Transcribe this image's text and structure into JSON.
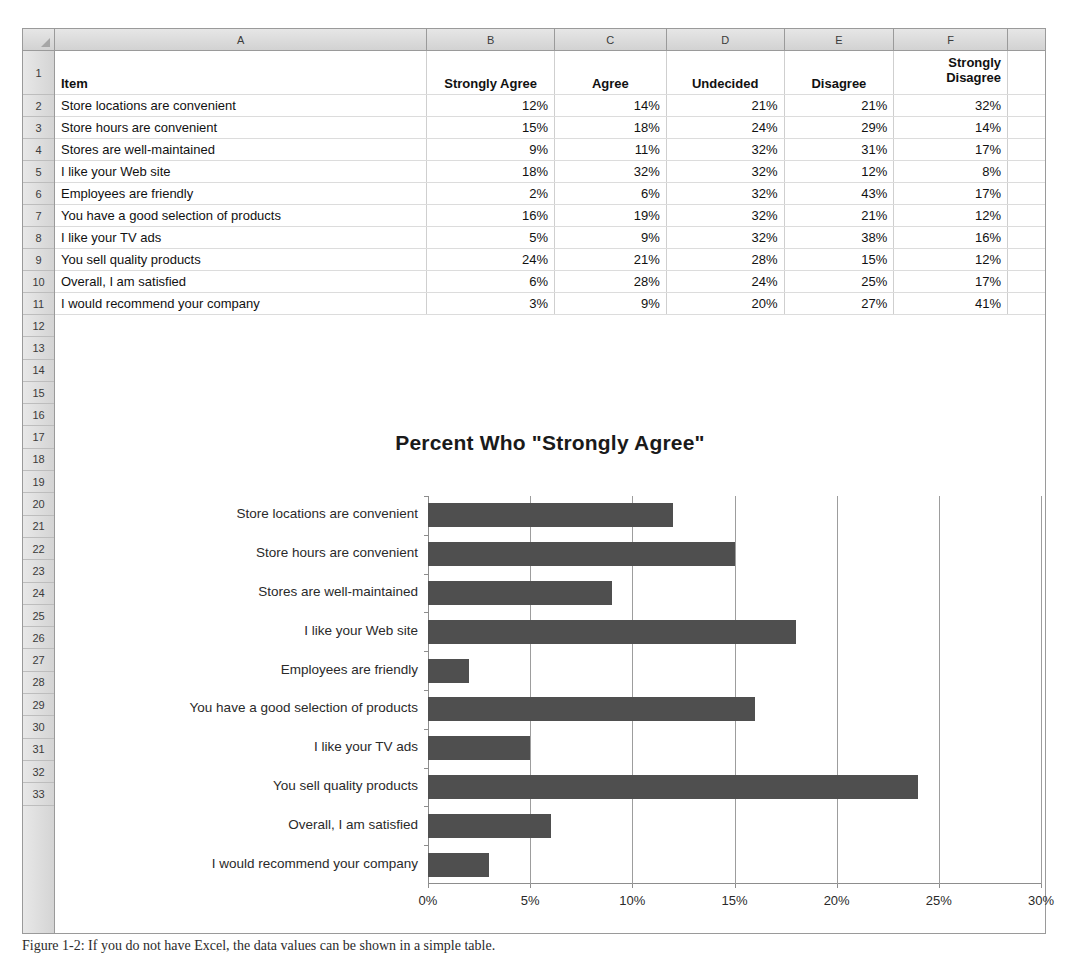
{
  "spreadsheet": {
    "corner_icon": "select-all-triangle-icon",
    "column_letters": [
      "A",
      "B",
      "C",
      "D",
      "E",
      "F"
    ],
    "row_numbers": [
      "1",
      "2",
      "3",
      "4",
      "5",
      "6",
      "7",
      "8",
      "9",
      "10",
      "11",
      "12",
      "13",
      "14",
      "15",
      "16",
      "17",
      "18",
      "19",
      "20",
      "21",
      "22",
      "23",
      "24",
      "25",
      "26",
      "27",
      "28",
      "29",
      "30",
      "31",
      "32",
      "33"
    ],
    "headers": [
      "Item",
      "Strongly Agree",
      "Agree",
      "Undecided",
      "Disagree",
      "Strongly Disagree"
    ],
    "header_wrapped": {
      "f_line1": "Strongly",
      "f_line2": "Disagree"
    },
    "rows": [
      {
        "row": "2",
        "item": "Store locations are convenient",
        "strongly_agree": "12%",
        "agree": "14%",
        "undecided": "21%",
        "disagree": "21%",
        "strongly_disagree": "32%"
      },
      {
        "row": "3",
        "item": "Store hours are convenient",
        "strongly_agree": "15%",
        "agree": "18%",
        "undecided": "24%",
        "disagree": "29%",
        "strongly_disagree": "14%"
      },
      {
        "row": "4",
        "item": "Stores are well-maintained",
        "strongly_agree": "9%",
        "agree": "11%",
        "undecided": "32%",
        "disagree": "31%",
        "strongly_disagree": "17%"
      },
      {
        "row": "5",
        "item": "I like your Web site",
        "strongly_agree": "18%",
        "agree": "32%",
        "undecided": "32%",
        "disagree": "12%",
        "strongly_disagree": "8%"
      },
      {
        "row": "6",
        "item": "Employees are friendly",
        "strongly_agree": "2%",
        "agree": "6%",
        "undecided": "32%",
        "disagree": "43%",
        "strongly_disagree": "17%"
      },
      {
        "row": "7",
        "item": "You have a good selection of products",
        "strongly_agree": "16%",
        "agree": "19%",
        "undecided": "32%",
        "disagree": "21%",
        "strongly_disagree": "12%"
      },
      {
        "row": "8",
        "item": "I like your TV ads",
        "strongly_agree": "5%",
        "agree": "9%",
        "undecided": "32%",
        "disagree": "38%",
        "strongly_disagree": "16%"
      },
      {
        "row": "9",
        "item": "You sell quality products",
        "strongly_agree": "24%",
        "agree": "21%",
        "undecided": "28%",
        "disagree": "15%",
        "strongly_disagree": "12%"
      },
      {
        "row": "10",
        "item": "Overall, I am satisfied",
        "strongly_agree": "6%",
        "agree": "28%",
        "undecided": "24%",
        "disagree": "25%",
        "strongly_disagree": "17%"
      },
      {
        "row": "11",
        "item": "I would recommend your company",
        "strongly_agree": "3%",
        "agree": "9%",
        "undecided": "20%",
        "disagree": "27%",
        "strongly_disagree": "41%"
      }
    ]
  },
  "chart_data": {
    "type": "bar",
    "orientation": "horizontal",
    "title": "Percent  Who \"Strongly Agree\"",
    "xlabel": "",
    "ylabel": "",
    "categories": [
      "Store locations are convenient",
      "Store hours are convenient",
      "Stores are well-maintained",
      "I like your Web site",
      "Employees are friendly",
      "You have a good selection of products",
      "I like your TV ads",
      "You sell quality products",
      "Overall, I am satisfied",
      "I would recommend your company"
    ],
    "values": [
      12,
      15,
      9,
      18,
      2,
      16,
      5,
      24,
      6,
      3
    ],
    "value_labels": [
      "12%",
      "15%",
      "9%",
      "18%",
      "2%",
      "16%",
      "5%",
      "24%",
      "6%",
      "3%"
    ],
    "xlim": [
      0,
      30
    ],
    "xticks": [
      0,
      5,
      10,
      15,
      20,
      25,
      30
    ],
    "xtick_labels": [
      "0%",
      "5%",
      "10%",
      "15%",
      "20%",
      "25%",
      "30%"
    ],
    "grid": true,
    "legend": false,
    "bar_color": "#4f4f4f",
    "series_name": "Strongly Agree"
  },
  "caption": {
    "text": "Figure 1-2: If you do not have Excel, the data values can be shown in a simple table."
  },
  "colors": {
    "header_fill": "#d9d9d9",
    "grid_border": "#cfcfcf",
    "bar": "#4f4f4f",
    "text": "#111111"
  }
}
